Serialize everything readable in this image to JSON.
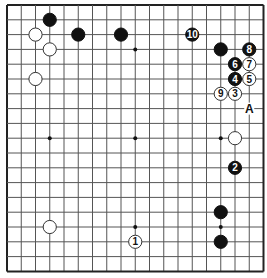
{
  "board": {
    "size": 19,
    "origin_x": 7,
    "origin_y": 5,
    "step_x": 14.25,
    "step_y": 14.8,
    "colors": {
      "background": "#ffffff",
      "line": "#555555",
      "border": "#222222",
      "black_stone": "#111111",
      "white_stone": "#ffffff",
      "white_stroke": "#333333"
    },
    "star_points": [
      [
        3,
        3
      ],
      [
        9,
        3
      ],
      [
        15,
        3
      ],
      [
        3,
        9
      ],
      [
        9,
        9
      ],
      [
        15,
        9
      ],
      [
        3,
        15
      ],
      [
        9,
        15
      ],
      [
        15,
        15
      ]
    ]
  },
  "stones": [
    {
      "color": "black",
      "col": 3,
      "row": 1,
      "label": ""
    },
    {
      "color": "white",
      "col": 2,
      "row": 2,
      "label": ""
    },
    {
      "color": "black",
      "col": 5,
      "row": 2,
      "label": ""
    },
    {
      "color": "black",
      "col": 8,
      "row": 2,
      "label": ""
    },
    {
      "color": "white",
      "col": 3,
      "row": 3,
      "label": ""
    },
    {
      "color": "white",
      "col": 2,
      "row": 5,
      "label": ""
    },
    {
      "color": "black",
      "col": 13,
      "row": 2,
      "label": "10"
    },
    {
      "color": "black",
      "col": 15,
      "row": 3,
      "label": ""
    },
    {
      "color": "black",
      "col": 17,
      "row": 3,
      "label": "8"
    },
    {
      "color": "black",
      "col": 16,
      "row": 4,
      "label": "6"
    },
    {
      "color": "white",
      "col": 17,
      "row": 4,
      "label": "7"
    },
    {
      "color": "black",
      "col": 16,
      "row": 5,
      "label": "4"
    },
    {
      "color": "white",
      "col": 17,
      "row": 5,
      "label": "5"
    },
    {
      "color": "white",
      "col": 15,
      "row": 6,
      "label": "9"
    },
    {
      "color": "white",
      "col": 16,
      "row": 6,
      "label": "3"
    },
    {
      "color": "white",
      "col": 16,
      "row": 9,
      "label": ""
    },
    {
      "color": "black",
      "col": 16,
      "row": 11,
      "label": "2"
    },
    {
      "color": "black",
      "col": 15,
      "row": 14,
      "label": ""
    },
    {
      "color": "black",
      "col": 15,
      "row": 16,
      "label": ""
    },
    {
      "color": "white",
      "col": 3,
      "row": 15,
      "label": ""
    },
    {
      "color": "white",
      "col": 9,
      "row": 16,
      "label": "1"
    }
  ],
  "markers": [
    {
      "text": "A",
      "col": 17,
      "row": 7
    }
  ]
}
